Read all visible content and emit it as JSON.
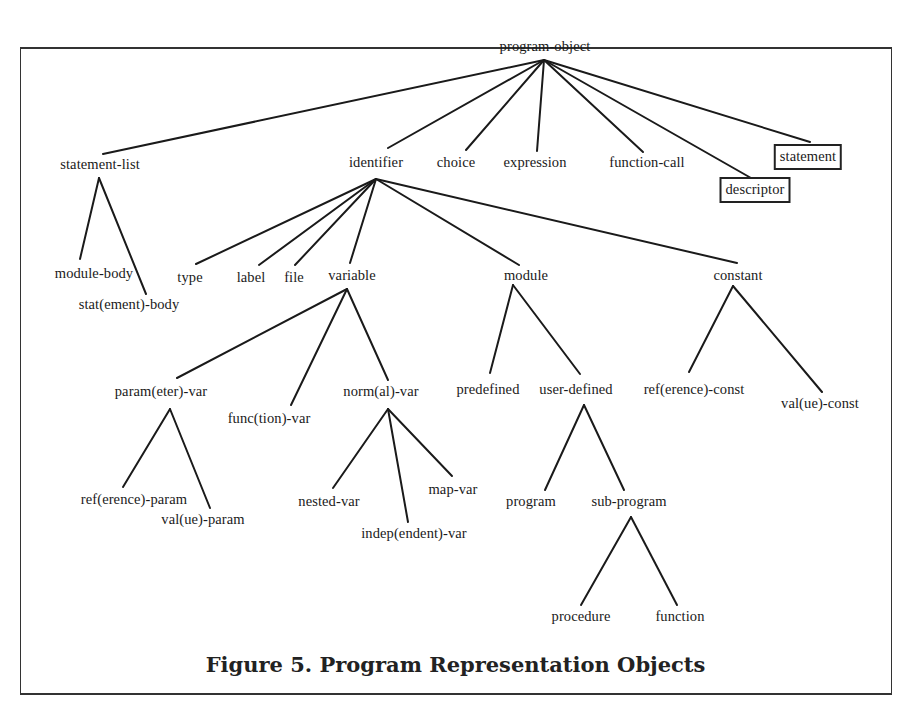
{
  "caption": "Figure 5. Program Representation Objects",
  "nodes": {
    "program_object": "program-object",
    "statement_list": "statement-list",
    "identifier": "identifier",
    "choice": "choice",
    "expression": "expression",
    "function_call": "function-call",
    "descriptor": "descriptor",
    "statement": "statement",
    "module_body": "module-body",
    "statement_body": "stat(ement)-body",
    "type": "type",
    "label": "label",
    "file": "file",
    "variable": "variable",
    "module": "module",
    "constant": "constant",
    "parameter_var": "param(eter)-var",
    "function_var": "func(tion)-var",
    "normal_var": "norm(al)-var",
    "predefined": "predefined",
    "user_defined": "user-defined",
    "reference_const": "ref(erence)-const",
    "value_const": "val(ue)-const",
    "reference_param": "ref(erence)-param",
    "value_param": "val(ue)-param",
    "nested_var": "nested-var",
    "independent_var": "indep(endent)-var",
    "map_var": "map-var",
    "program": "program",
    "sub_program": "sub-program",
    "procedure": "procedure",
    "function": "function"
  },
  "edges": [
    [
      "program-object",
      "statement-list"
    ],
    [
      "program-object",
      "identifier"
    ],
    [
      "program-object",
      "choice"
    ],
    [
      "program-object",
      "expression"
    ],
    [
      "program-object",
      "function-call"
    ],
    [
      "program-object",
      "descriptor"
    ],
    [
      "program-object",
      "statement"
    ],
    [
      "statement-list",
      "module-body"
    ],
    [
      "statement-list",
      "stat(ement)-body"
    ],
    [
      "identifier",
      "type"
    ],
    [
      "identifier",
      "label"
    ],
    [
      "identifier",
      "file"
    ],
    [
      "identifier",
      "variable"
    ],
    [
      "identifier",
      "module"
    ],
    [
      "identifier",
      "constant"
    ],
    [
      "variable",
      "param(eter)-var"
    ],
    [
      "variable",
      "func(tion)-var"
    ],
    [
      "variable",
      "norm(al)-var"
    ],
    [
      "module",
      "predefined"
    ],
    [
      "module",
      "user-defined"
    ],
    [
      "constant",
      "ref(erence)-const"
    ],
    [
      "constant",
      "val(ue)-const"
    ],
    [
      "param(eter)-var",
      "ref(erence)-param"
    ],
    [
      "param(eter)-var",
      "val(ue)-param"
    ],
    [
      "norm(al)-var",
      "nested-var"
    ],
    [
      "norm(al)-var",
      "indep(endent)-var"
    ],
    [
      "norm(al)-var",
      "map-var"
    ],
    [
      "user-defined",
      "program"
    ],
    [
      "user-defined",
      "sub-program"
    ],
    [
      "sub-program",
      "procedure"
    ],
    [
      "sub-program",
      "function"
    ]
  ],
  "boxed_nodes": [
    "descriptor",
    "statement"
  ]
}
